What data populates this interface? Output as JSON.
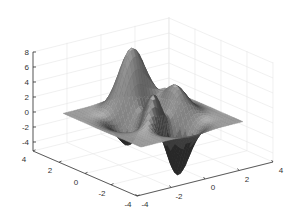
{
  "chart_data": {
    "type": "surface",
    "title": "",
    "function": "peaks",
    "xlabel": "",
    "ylabel": "",
    "zlabel": "",
    "x_ticks": [
      -4,
      -2,
      0,
      2,
      4
    ],
    "y_ticks": [
      4,
      2,
      0,
      -2,
      -4
    ],
    "z_ticks": [
      8,
      6,
      4,
      2,
      0,
      -2,
      -4
    ],
    "x_tick_labels": [
      "-4",
      "-2",
      "0",
      "2",
      "4"
    ],
    "y_tick_labels": [
      "4",
      "2",
      "0",
      "-2",
      "-4"
    ],
    "z_tick_labels": [
      "8",
      "6",
      "4",
      "2",
      "0",
      "-2",
      "-4"
    ],
    "xlim": [
      -4,
      4
    ],
    "ylim": [
      -4,
      4
    ],
    "zlim": [
      -5.2,
      8.1
    ],
    "surface_domain": [
      -3,
      3
    ],
    "surface_max": 8.1,
    "surface_min": -6.55,
    "grid": true,
    "legend": null,
    "colormap": "gray",
    "view": "3d-default"
  },
  "colors": {
    "surface_light": "#b8b8b8",
    "surface_dark": "#2e2e2e",
    "axis": "#333333",
    "grid": "#e6e6e6",
    "background": "#ffffff"
  }
}
